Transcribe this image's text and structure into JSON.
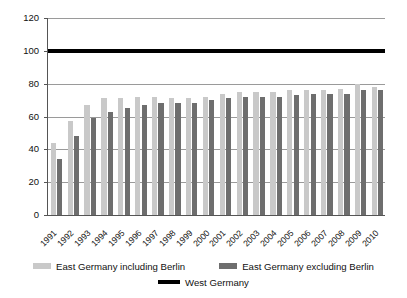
{
  "chart_data": {
    "type": "bar",
    "title": "",
    "subtitle": "",
    "xlabel": "",
    "ylabel": "",
    "ylim": [
      0,
      120
    ],
    "ytick_step": 20,
    "yticks": [
      "0",
      "20",
      "40",
      "60",
      "80",
      "100",
      "120"
    ],
    "grid": true,
    "legend_position": "bottom",
    "categories": [
      "1991",
      "1992",
      "1993",
      "1994",
      "1995",
      "1996",
      "1997",
      "1998",
      "1999",
      "2000",
      "2001",
      "2002",
      "2003",
      "2004",
      "2005",
      "2006",
      "2007",
      "2008",
      "2009",
      "2010"
    ],
    "series": [
      {
        "name": "East Germany including Berlin",
        "color": "#c9c9c9",
        "type": "bar",
        "values": [
          44,
          57,
          67,
          71,
          71,
          72,
          72,
          71,
          71,
          72,
          74,
          75,
          75,
          75,
          76,
          76,
          76,
          77,
          80,
          78
        ]
      },
      {
        "name": "East Germany excluding Berlin",
        "color": "#6e6e6e",
        "type": "bar",
        "values": [
          34,
          48,
          59,
          63,
          65,
          67,
          68,
          68,
          68,
          70,
          71,
          72,
          72,
          72,
          73,
          74,
          74,
          74,
          76,
          76
        ]
      },
      {
        "name": "West Germany",
        "color": "#000000",
        "type": "line",
        "constant_value": 100,
        "values": [
          100,
          100,
          100,
          100,
          100,
          100,
          100,
          100,
          100,
          100,
          100,
          100,
          100,
          100,
          100,
          100,
          100,
          100,
          100,
          100
        ]
      }
    ]
  },
  "legend": {
    "including_berlin": "East Germany including Berlin",
    "excluding_berlin": "East Germany excluding Berlin",
    "west_germany": "West Germany"
  },
  "colors": {
    "incl_berlin": "#c9c9c9",
    "excl_berlin": "#6e6e6e",
    "west_germany": "#000000",
    "gridline": "#9a9a9a",
    "axis": "#555555",
    "background": "#ffffff"
  }
}
